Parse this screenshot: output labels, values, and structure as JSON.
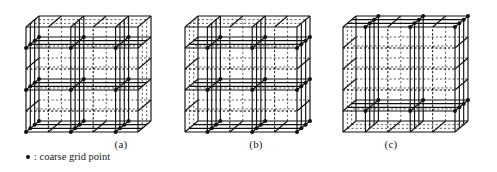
{
  "figure": {
    "kind": "diagram",
    "background_color": "#ffffff",
    "line_color": "#111111",
    "coarse_point_color": "#111111",
    "fine_line_style": "dashed",
    "coarse_line_style": "solid"
  },
  "panels": [
    {
      "id": "a",
      "label": "(a)",
      "label_x": 121,
      "label_y": 138,
      "origin_x": 26,
      "origin_y": 132,
      "cell_w": 22.4,
      "cell_h": 21.0,
      "depth_dx": 13.0,
      "depth_dy": -11.0,
      "nx": 5,
      "ny": 5,
      "nz": 3,
      "coarse_step_x": 2,
      "coarse_step_y": 2,
      "coarse_step_z": 1,
      "coarse_offset_x": 0,
      "coarse_offset_y": 0
    },
    {
      "id": "b",
      "label": "(b)",
      "label_x": 256,
      "label_y": 138,
      "origin_x": 185,
      "origin_y": 132,
      "cell_w": 22.4,
      "cell_h": 21.0,
      "depth_dx": 13.0,
      "depth_dy": -11.0,
      "nx": 5,
      "ny": 5,
      "nz": 3,
      "coarse_step_x": 2,
      "coarse_step_y": 2,
      "coarse_step_z": 1,
      "coarse_offset_x": 1,
      "coarse_offset_y": 0
    },
    {
      "id": "c",
      "label": "(c)",
      "label_x": 391,
      "label_y": 138,
      "origin_x": 343,
      "origin_y": 132,
      "cell_w": 22.4,
      "cell_h": 21.0,
      "depth_dx": 13.0,
      "depth_dy": -11.0,
      "nx": 5,
      "ny": 5,
      "nz": 3,
      "coarse_step_x": 2,
      "coarse_step_y": 4,
      "coarse_step_z": 1,
      "coarse_offset_x": 1,
      "coarse_offset_y": 1
    }
  ],
  "legend": {
    "marker": "•",
    "text": ": coarse grid point"
  }
}
